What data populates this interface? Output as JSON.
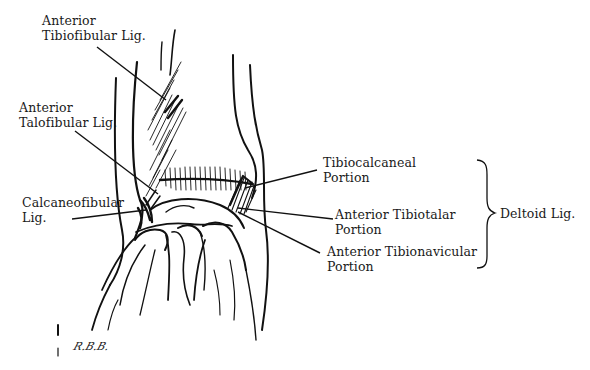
{
  "figure": {
    "labels": {
      "anterior_tibiofibular": {
        "line1": "Anterior",
        "line2": "Tibiofibular Lig."
      },
      "anterior_talofibular": {
        "line1": "Anterior",
        "line2": "Talofibular Lig."
      },
      "calcaneofibular": {
        "line1": "Calcaneofibular",
        "line2": "Lig."
      },
      "tibiocalcaneal": {
        "line1": "Tibiocalcaneal",
        "line2": "Portion"
      },
      "anterior_tibiotalar": {
        "line1": "Anterior Tibiotalar",
        "line2": "Portion"
      },
      "anterior_tibionavicular": {
        "line1": "Anterior Tibionavicular",
        "line2": "Portion"
      },
      "deltoid": {
        "text": "Deltoid Lig."
      }
    },
    "signature": "R.B.B.",
    "colors": {
      "ink": "#111111",
      "background": "#ffffff"
    }
  }
}
